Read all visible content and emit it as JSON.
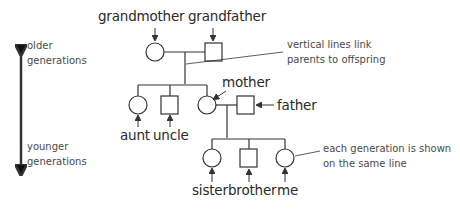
{
  "diagram": {
    "people": {
      "grandmother": {
        "label": "grandmother",
        "symbol": "circle"
      },
      "grandfather": {
        "label": "grandfather",
        "symbol": "square"
      },
      "mother": {
        "label": "mother",
        "symbol": "circle"
      },
      "father": {
        "label": "father",
        "symbol": "square"
      },
      "aunt": {
        "label": "aunt",
        "symbol": "circle"
      },
      "uncle": {
        "label": "uncle",
        "symbol": "square"
      },
      "sister": {
        "label": "sister",
        "symbol": "circle"
      },
      "brother": {
        "label": "brother",
        "symbol": "square"
      },
      "me": {
        "label": "me",
        "symbol": "circle"
      }
    },
    "axis": {
      "top_line1": "older",
      "top_line2": "generations",
      "bottom_line1": "younger",
      "bottom_line2": "generations"
    },
    "annotations": {
      "vertical_line1": "vertical lines link",
      "vertical_line2": "parents to offspring",
      "generation_line1": "each generation is shown",
      "generation_line2": "on the same line"
    },
    "colors": {
      "stroke": "#333333",
      "text": "#2a2a2a",
      "note_text": "#4a4a4a"
    }
  }
}
